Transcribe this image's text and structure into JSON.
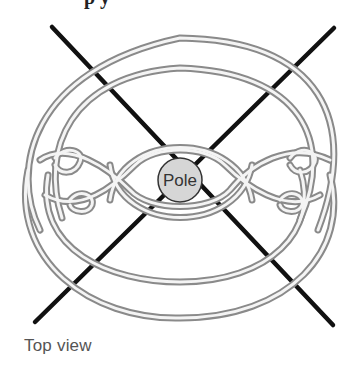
{
  "partial_heading": "p  y",
  "diagram": {
    "pole_label": "Pole",
    "caption": "Top view",
    "colors": {
      "rope_outer": "#8a8a8a",
      "rope_inner": "#f2f2f2",
      "stake_line": "#111111",
      "pole_fill": "#d6d6d6",
      "pole_stroke": "#333333"
    }
  }
}
